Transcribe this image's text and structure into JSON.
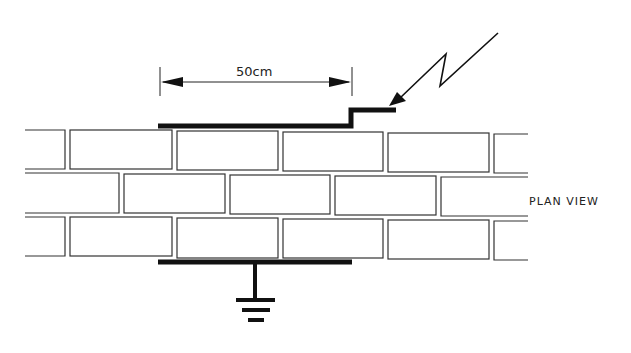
{
  "diagram": {
    "dimension_label": "50cm",
    "view_label": "PLAN VIEW",
    "elements": [
      "brick-wall",
      "top-conductor-strip",
      "bottom-conductor-strip",
      "lightning-bolt",
      "ground-symbol",
      "dimension-arrow"
    ],
    "colors": {
      "line": "#1a1a1a",
      "background": "#ffffff"
    }
  }
}
